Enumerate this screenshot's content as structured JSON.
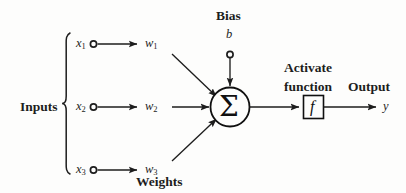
{
  "figure": {
    "type": "neuron-model-diagram",
    "background_color": "#fdfdfc",
    "ink_color": "#1d1d1d"
  },
  "labels": {
    "inputs": "Inputs",
    "weights": "Weights",
    "bias": "Bias",
    "bias_symbol": "b",
    "activate_line1": "Activate",
    "activate_line2": "function",
    "output": "Output",
    "output_symbol": "y",
    "sum_symbol": "Σ",
    "activation_symbol": "f"
  },
  "inputs": [
    {
      "base": "x",
      "subscript": "1"
    },
    {
      "base": "x",
      "subscript": "2"
    },
    {
      "base": "x",
      "subscript": "3"
    }
  ],
  "weights": [
    {
      "base": "w",
      "subscript": "1"
    },
    {
      "base": "w",
      "subscript": "2"
    },
    {
      "base": "w",
      "subscript": "3"
    }
  ]
}
